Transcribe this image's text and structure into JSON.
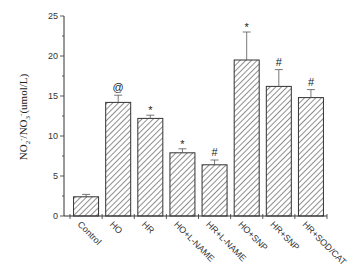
{
  "chart_data": {
    "type": "bar",
    "title": "",
    "xlabel": "",
    "ylabel": "NO2-/NO3-(umol/L)",
    "ylabel_parts": {
      "a": "NO",
      "a_sub": "2",
      "a_sup": "-",
      "sep": "/NO",
      "b_sub": "3",
      "b_sup": "-",
      "unit": "(umol/L)"
    },
    "ylim": [
      0,
      25
    ],
    "yticks": [
      0,
      5,
      10,
      15,
      20,
      25
    ],
    "grid": false,
    "legend": null,
    "pattern": "diagonal-hatch",
    "categories": [
      "Control",
      "HO",
      "HR",
      "HO+L-NAME",
      "HR+L-NAME",
      "HO+SNP",
      "HR+SNP",
      "HR+SOD/CAT"
    ],
    "values": [
      2.4,
      14.2,
      12.2,
      7.9,
      6.4,
      19.5,
      16.2,
      14.8
    ],
    "error": [
      0.3,
      0.9,
      0.4,
      0.5,
      0.6,
      3.5,
      2.1,
      1.0
    ],
    "annotations": [
      "",
      "@",
      "*",
      "*",
      "#",
      "*",
      "#",
      "#"
    ]
  }
}
